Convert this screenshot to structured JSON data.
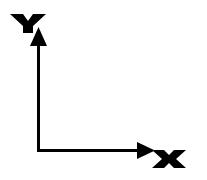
{
  "diagram": {
    "type": "coordinate-axes",
    "y_axis": {
      "label": "Y",
      "direction": "up"
    },
    "x_axis": {
      "label": "X",
      "direction": "right"
    },
    "colors": {
      "stroke": "#000000",
      "background": "#ffffff"
    }
  }
}
